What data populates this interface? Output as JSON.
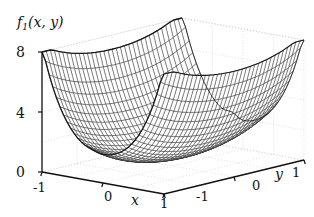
{
  "figure": {
    "background_color": "#ffffff",
    "ink_color": "#111111",
    "grid_color": "#b9b9b9",
    "mesh_color": "#1a1a1a",
    "zaxis_label": "f",
    "zaxis_label_sub": "1",
    "zaxis_label_args": "(x, y)",
    "xaxis_label": "x",
    "yaxis_label": "y"
  },
  "ticks": {
    "z": [
      "8",
      "4",
      "0"
    ],
    "x": [
      "-1",
      "0",
      "1"
    ],
    "y": [
      "-1",
      "0",
      "1"
    ]
  },
  "chart_data": {
    "type": "surface",
    "xlabel": "x",
    "ylabel": "y",
    "zlabel": "f_1(x, y)",
    "xlim": [
      -1,
      1
    ],
    "ylim": [
      -1,
      1
    ],
    "zlim": [
      0,
      8
    ],
    "xticks": [
      -1,
      0,
      1
    ],
    "yticks": [
      -1,
      0,
      1
    ],
    "zticks": [
      0,
      4,
      8
    ],
    "grid": true,
    "legend": "none",
    "mesh_style": "wireframe",
    "x": [
      -1,
      -0.75,
      -0.5,
      -0.25,
      0,
      0.25,
      0.5,
      0.75,
      1
    ],
    "y": [
      -1,
      -0.75,
      -0.5,
      -0.25,
      0,
      0.25,
      0.5,
      0.75,
      1
    ],
    "z": [
      [
        7.0,
        5.3,
        3.8,
        2.6,
        2.0,
        2.2,
        3.1,
        4.7,
        7.0
      ],
      [
        6.2,
        4.6,
        3.2,
        2.1,
        1.5,
        1.7,
        2.5,
        4.0,
        6.2
      ],
      [
        5.5,
        3.9,
        2.6,
        1.6,
        1.1,
        1.3,
        2.0,
        3.4,
        5.5
      ],
      [
        5.0,
        3.5,
        2.2,
        1.2,
        0.8,
        0.9,
        1.6,
        2.9,
        5.0
      ],
      [
        4.8,
        3.3,
        2.0,
        1.0,
        0.5,
        0.7,
        1.4,
        2.7,
        4.8
      ],
      [
        5.0,
        3.5,
        2.2,
        1.2,
        0.8,
        0.9,
        1.6,
        2.9,
        5.0
      ],
      [
        5.5,
        3.9,
        2.6,
        1.6,
        1.1,
        1.3,
        2.0,
        3.4,
        5.5
      ],
      [
        6.2,
        4.6,
        3.2,
        2.1,
        1.5,
        1.7,
        2.5,
        4.0,
        6.2
      ],
      [
        7.0,
        5.3,
        3.8,
        2.6,
        2.0,
        2.2,
        3.1,
        4.7,
        7.0
      ]
    ]
  }
}
